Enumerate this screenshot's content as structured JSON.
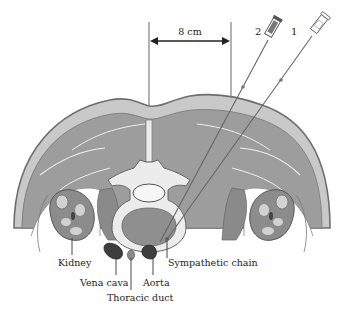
{
  "diagram": {
    "measurement": {
      "label": "8 cm"
    },
    "needles": [
      {
        "id": "2",
        "label": "2"
      },
      {
        "id": "1",
        "label": "1"
      }
    ],
    "labels": {
      "kidney": "Kidney",
      "vena_cava": "Vena cava",
      "thoracic_duct": "Thoracic duct",
      "aorta": "Aorta",
      "sympathetic_chain": "Sympathetic chain"
    },
    "colors": {
      "skin_outline": "#6e6e6e",
      "subcutaneous": "#c9c9c9",
      "muscle": "#9d9d9d",
      "muscle_dark": "#8a8a8a",
      "bone": "#ececec",
      "marrow": "#8f8f8f",
      "kidney_fill": "#8c8c8c",
      "kidney_inner": "#d2d2d2",
      "vessel_dark": "#3e3e3e",
      "line": "#444444"
    }
  }
}
